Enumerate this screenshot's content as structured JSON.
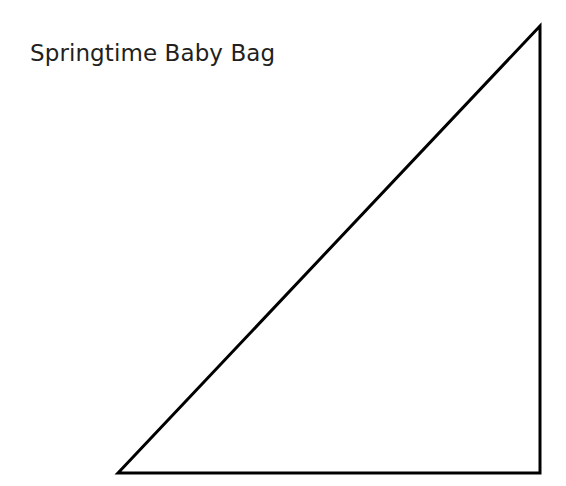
{
  "canvas": {
    "width": 566,
    "height": 486,
    "background_color": "#ffffff"
  },
  "title": {
    "text": "Springtime Baby Bag",
    "color": "#231f20",
    "x": 30,
    "y": 39
  },
  "figure": {
    "name": "right-triangle",
    "shape": "triangle",
    "stroke_color": "#000000",
    "fill_color": "none",
    "stroke_width": 3,
    "points": "118,473 540,26 540,473",
    "vertices": [
      {
        "label": "bottom-left",
        "x": 118,
        "y": 473
      },
      {
        "label": "apex-top-right",
        "x": 540,
        "y": 26
      },
      {
        "label": "bottom-right",
        "x": 540,
        "y": 473
      }
    ]
  }
}
